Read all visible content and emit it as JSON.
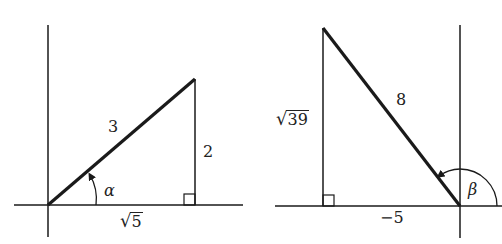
{
  "colors": {
    "stroke": "#1a1a1a",
    "background": "#ffffff",
    "text": "#222222"
  },
  "figures": [
    {
      "id": "left",
      "hypotenuse_label": "3",
      "vertical_leg_label": "2",
      "horizontal_leg_radicand": "5",
      "angle_label": "α"
    },
    {
      "id": "right",
      "hypotenuse_label": "8",
      "vertical_leg_radicand": "39",
      "horizontal_leg_label": "−5",
      "angle_label": "β"
    }
  ],
  "symbols": {
    "sqrt": "√"
  }
}
